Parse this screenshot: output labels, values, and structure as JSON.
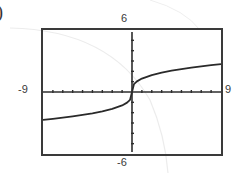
{
  "figure_label_fragment": ")",
  "window": {
    "xmin": "-9",
    "xmax": "9",
    "ymin": "-6",
    "ymax": "6"
  },
  "colors": {
    "frame": "#3a3a3a",
    "axis": "#2e2e2e",
    "curve": "#2a2a2a",
    "background": "#ffffff"
  },
  "chart_data": {
    "type": "line",
    "title": "",
    "xlabel": "",
    "ylabel": "",
    "xlim": [
      -9,
      9
    ],
    "ylim": [
      -6,
      6
    ],
    "grid": false,
    "legend": null,
    "axis_tick_spacing": {
      "x": 1,
      "y": 1
    },
    "tick_labels": {
      "left": "-9",
      "right": "9",
      "top": "6",
      "bottom": "-6"
    },
    "series": [
      {
        "name": "f(x)",
        "x": [
          -9,
          -8,
          -7,
          -6,
          -5,
          -4,
          -3,
          -2,
          -1,
          -0.5,
          -0.2,
          0,
          0.2,
          0.5,
          1,
          2,
          3,
          4,
          5,
          6,
          7,
          8,
          9
        ],
        "y": [
          -2.7,
          -2.6,
          -2.49,
          -2.36,
          -2.22,
          -2.06,
          -1.87,
          -1.64,
          -1.3,
          -1.03,
          -0.76,
          0,
          0.76,
          1.03,
          1.3,
          1.64,
          1.87,
          2.06,
          2.22,
          2.36,
          2.49,
          2.6,
          2.7
        ]
      }
    ]
  }
}
